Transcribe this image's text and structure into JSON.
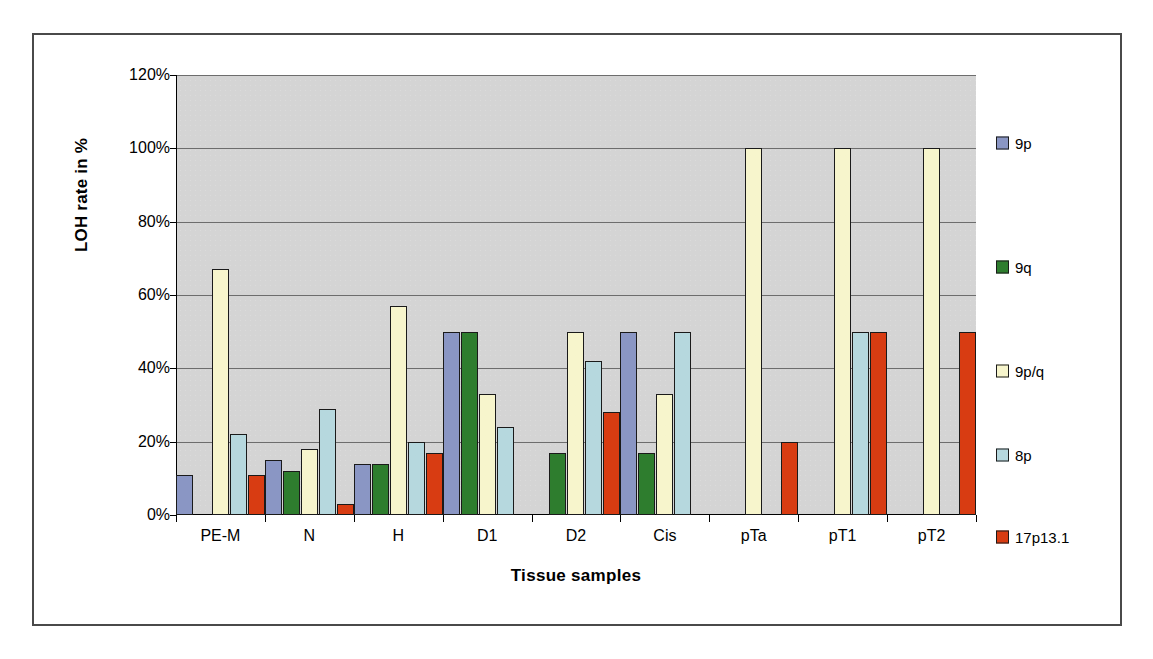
{
  "chart_data": {
    "type": "bar",
    "title": "",
    "xlabel": "Tissue samples",
    "ylabel": "LOH rate in %",
    "categories": [
      "PE-M",
      "N",
      "H",
      "D1",
      "D2",
      "Cis",
      "pTa",
      "pT1",
      "pT2"
    ],
    "ylim": [
      0,
      120
    ],
    "ytick_values": [
      0,
      20,
      40,
      60,
      80,
      100,
      120
    ],
    "ytick_labels": [
      "0%",
      "20%",
      "40%",
      "60%",
      "80%",
      "100%",
      "120%"
    ],
    "grid": true,
    "legend_position": "right",
    "plot_background": "#d4d4d4",
    "series": [
      {
        "name": "9p",
        "color": "#8a96c4",
        "values": [
          11,
          15,
          14,
          50,
          0,
          50,
          0,
          0,
          0
        ]
      },
      {
        "name": "9q",
        "color": "#2e7d2e",
        "values": [
          0,
          12,
          14,
          50,
          17,
          17,
          0,
          0,
          0
        ]
      },
      {
        "name": "9p/q",
        "color": "#f7f5cc",
        "values": [
          67,
          18,
          57,
          33,
          50,
          33,
          100,
          100,
          100
        ]
      },
      {
        "name": "8p",
        "color": "#b6d8de",
        "values": [
          22,
          29,
          20,
          24,
          42,
          50,
          0,
          50,
          0
        ]
      },
      {
        "name": "17p13.1",
        "color": "#d83c12",
        "values": [
          11,
          3,
          17,
          0,
          28,
          0,
          20,
          50,
          50
        ]
      }
    ]
  }
}
